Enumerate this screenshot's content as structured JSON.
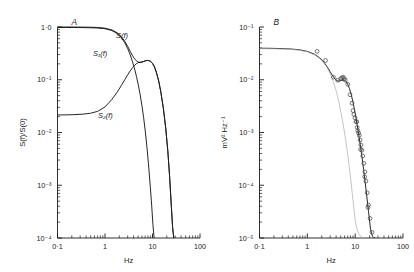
{
  "figure": {
    "background": "#ffffff",
    "panels": [
      {
        "id": "panel-a",
        "letter": "A",
        "axes": {
          "x": {
            "label": "Hz",
            "scale": "log",
            "min": 0.1,
            "max": 100,
            "tick_labels": [
              "0·1",
              "1",
              "10",
              "100"
            ],
            "tick_values": [
              0.1,
              1,
              10,
              100
            ]
          },
          "y": {
            "label": "S(f)/S(0)",
            "scale": "log",
            "min": 0.0001,
            "max": 1,
            "tick_labels": [
              "1·0",
              "10⁻¹",
              "10⁻²",
              "10⁻³",
              "10⁻⁴"
            ],
            "tick_values": [
              1,
              0.1,
              0.01,
              0.001,
              0.0001
            ]
          }
        },
        "curve_labels": [
          {
            "name": "S(f)",
            "text": "S(f)",
            "x": 116,
            "y": 38
          },
          {
            "name": "S1(f)",
            "text": "S₁(f)",
            "x": 93,
            "y": 56
          },
          {
            "name": "S2(f)",
            "text": "S₂(f)",
            "x": 98,
            "y": 118
          }
        ]
      },
      {
        "id": "panel-b",
        "letter": "B",
        "axes": {
          "x": {
            "label": "Hz",
            "scale": "log",
            "min": 0.1,
            "max": 100,
            "tick_labels": [
              "0·1",
              "1",
              "10",
              "100"
            ],
            "tick_values": [
              0.1,
              1,
              10,
              100
            ]
          },
          "y": {
            "label": "mV² Hz⁻¹",
            "scale": "log",
            "min": 1e-05,
            "max": 0.1,
            "tick_labels": [
              "10⁻¹",
              "10⁻²",
              "10⁻³",
              "10⁻⁴",
              "10⁻⁵"
            ],
            "tick_values": [
              0.1,
              0.01,
              0.001,
              0.0001,
              1e-05
            ]
          }
        },
        "curve_labels": []
      }
    ]
  },
  "chart_data": [
    {
      "type": "line",
      "panel": "A",
      "title": "A",
      "xlabel": "Hz",
      "ylabel": "S(f)/S(0)",
      "xscale": "log",
      "yscale": "log",
      "xlim": [
        0.1,
        100
      ],
      "ylim": [
        0.0001,
        1.0
      ],
      "grid": false,
      "legend": "inline-curve-labels",
      "series": [
        {
          "name": "S(f)",
          "color": "#1a1a1a",
          "x": [
            0.1,
            0.15,
            0.22,
            0.33,
            0.5,
            0.7,
            1.0,
            1.4,
            1.8,
            2.2,
            2.6,
            3.0,
            3.4,
            3.8,
            4.2,
            4.6,
            5.0,
            5.5,
            6.0,
            6.5,
            7.0,
            7.6,
            8.2,
            9.0,
            10.0,
            11.0,
            12.0,
            13.5,
            15.0,
            17.0,
            19.0,
            21.0,
            23.0,
            25.0,
            26.5,
            28.0
          ],
          "y": [
            1.0,
            1.0,
            1.0,
            0.995,
            0.99,
            0.98,
            0.95,
            0.88,
            0.78,
            0.66,
            0.54,
            0.43,
            0.345,
            0.285,
            0.25,
            0.228,
            0.216,
            0.212,
            0.216,
            0.222,
            0.228,
            0.232,
            0.232,
            0.225,
            0.205,
            0.175,
            0.14,
            0.095,
            0.058,
            0.028,
            0.012,
            0.0045,
            0.0014,
            0.00038,
            0.00016,
            0.0001
          ]
        },
        {
          "name": "S1(f)",
          "color": "#1a1a1a",
          "x": [
            0.1,
            0.15,
            0.22,
            0.33,
            0.5,
            0.7,
            1.0,
            1.4,
            1.8,
            2.2,
            2.6,
            3.0,
            3.4,
            3.8,
            4.2,
            4.6,
            5.0,
            5.5,
            6.0,
            6.5,
            7.0,
            7.6,
            8.2,
            9.0,
            9.6,
            10.2,
            10.8
          ],
          "y": [
            0.978,
            0.978,
            0.977,
            0.974,
            0.968,
            0.957,
            0.928,
            0.855,
            0.752,
            0.63,
            0.505,
            0.39,
            0.295,
            0.219,
            0.16,
            0.115,
            0.082,
            0.052,
            0.032,
            0.0192,
            0.0112,
            0.0055,
            0.00262,
            0.00092,
            0.00042,
            0.00018,
            0.0001
          ]
        },
        {
          "name": "S2(f)",
          "color": "#1a1a1a",
          "x": [
            0.1,
            0.15,
            0.22,
            0.33,
            0.5,
            0.7,
            1.0,
            1.4,
            1.8,
            2.2,
            2.6,
            3.0,
            3.4,
            3.8,
            4.2,
            4.6,
            5.0,
            5.5,
            6.0,
            6.5,
            7.0,
            7.6,
            8.2,
            9.0,
            10.0,
            11.0,
            12.0,
            13.5,
            15.0,
            17.0,
            19.0,
            21.0,
            23.0,
            25.0,
            26.5,
            28.0
          ],
          "y": [
            0.0215,
            0.0216,
            0.0218,
            0.0222,
            0.0232,
            0.0252,
            0.0305,
            0.0425,
            0.058,
            0.0775,
            0.1,
            0.124,
            0.148,
            0.17,
            0.188,
            0.202,
            0.211,
            0.216,
            0.218,
            0.2215,
            0.2275,
            0.2315,
            0.2315,
            0.2245,
            0.205,
            0.175,
            0.14,
            0.095,
            0.058,
            0.028,
            0.012,
            0.0045,
            0.0014,
            0.00038,
            0.00016,
            0.0001
          ]
        }
      ]
    },
    {
      "type": "scatter+line",
      "panel": "B",
      "title": "B",
      "xlabel": "Hz",
      "ylabel": "mV² Hz⁻¹",
      "xscale": "log",
      "yscale": "log",
      "xlim": [
        0.1,
        100
      ],
      "ylim": [
        1e-05,
        0.1
      ],
      "grid": false,
      "legend": "none",
      "series": [
        {
          "name": "fitted-total-spectrum",
          "style": "line",
          "color": "#1a1a1a",
          "x": [
            0.1,
            0.15,
            0.22,
            0.33,
            0.5,
            0.7,
            1.0,
            1.4,
            1.8,
            2.2,
            2.6,
            3.0,
            3.4,
            3.8,
            4.2,
            4.6,
            5.0,
            5.5,
            6.0,
            6.5,
            7.0,
            7.6,
            8.2,
            9.0,
            10.0,
            11.0,
            12.0,
            13.5,
            15.0,
            17.0,
            19.0,
            21.0,
            23.0,
            24.5,
            26.0
          ],
          "y": [
            0.0395,
            0.0395,
            0.0392,
            0.0388,
            0.038,
            0.0368,
            0.0345,
            0.0305,
            0.0262,
            0.0218,
            0.0176,
            0.0142,
            0.0118,
            0.0103,
            0.0096,
            0.0094,
            0.0096,
            0.0098,
            0.0098,
            0.0092,
            0.0082,
            0.0068,
            0.0054,
            0.0038,
            0.0023,
            0.0014,
            0.00086,
            0.00042,
            0.0002,
            7.8e-05,
            3.2e-05,
            1.45e-05,
            1.08e-05,
            1.02e-05,
            1e-05
          ]
        },
        {
          "name": "component-spectrum",
          "style": "line",
          "color": "#b0b0b0",
          "x": [
            0.1,
            0.2,
            0.35,
            0.6,
            1.0,
            1.5,
            2.0,
            2.5,
            3.0,
            3.5,
            4.0,
            4.5,
            5.0,
            5.6,
            6.2,
            6.8,
            7.5,
            8.2,
            9.0,
            10.0,
            11.0,
            12.0,
            13.0,
            14.0,
            15.0
          ],
          "y": [
            0.0388,
            0.0385,
            0.038,
            0.0368,
            0.0338,
            0.0288,
            0.0232,
            0.0178,
            0.0131,
            0.0092,
            0.0062,
            0.004,
            0.0025,
            0.00145,
            0.00082,
            0.00046,
            0.00023,
            0.000115,
            5.2e-05,
            2.15e-05,
            1.45e-05,
            1.18e-05,
            1.08e-05,
            1.03e-05,
            1e-05
          ]
        },
        {
          "name": "measured-points",
          "style": "scatter",
          "marker": "open-circle",
          "color": "#4a4a4a",
          "x": [
            1.6,
            2.4,
            3.5,
            4.3,
            5.0,
            5.3,
            5.6,
            5.9,
            6.2,
            7.0,
            7.8,
            8.6,
            9.4,
            9.9,
            10.4,
            11.0,
            11.4,
            11.8,
            12.2,
            12.7,
            13.2,
            13.8,
            14.4,
            15.2,
            16.0,
            16.8,
            17.8,
            19.0,
            20.5,
            22.5,
            9.0,
            10.8,
            13.0,
            15.8,
            18.5
          ],
          "y": [
            0.0345,
            0.0232,
            0.0112,
            0.0098,
            0.0105,
            0.0108,
            0.0112,
            0.0105,
            0.0098,
            0.0082,
            0.0052,
            0.0036,
            0.0022,
            0.0019,
            0.0016,
            0.00125,
            0.00108,
            0.00098,
            0.00088,
            0.00072,
            0.00058,
            0.00046,
            0.00036,
            0.00026,
            0.00018,
            0.00012,
            7.2e-05,
            4.2e-05,
            2.35e-05,
            1.28e-05,
            0.0026,
            0.0016,
            0.00048,
            0.000145,
            3.8e-05
          ]
        }
      ]
    }
  ]
}
